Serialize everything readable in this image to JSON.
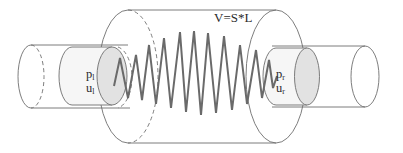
{
  "diagram": {
    "type": "schematic",
    "volume_label": "V=S*L",
    "left_piston": {
      "pressure_symbol": "p",
      "pressure_subscript": "l",
      "velocity_symbol": "u",
      "velocity_subscript": "l"
    },
    "right_piston": {
      "pressure_symbol": "p",
      "pressure_subscript": "r",
      "velocity_symbol": "u",
      "velocity_subscript": "r"
    },
    "colors": {
      "outline": "#6e6e6e",
      "spring": "#6a6a6a",
      "piston_fill": "#e2e2e2",
      "text": "#2a2a2a",
      "background": "#ffffff"
    }
  }
}
